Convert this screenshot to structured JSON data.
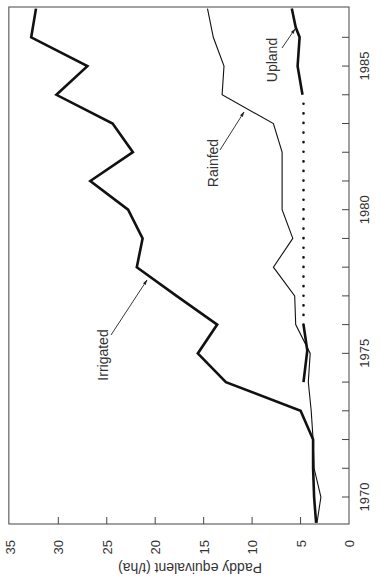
{
  "chart_data": {
    "type": "line",
    "orientation": "rotated-90-clockwise",
    "title": "",
    "xlabel": "",
    "ylabel": "Paddy equivalent (t/ha)",
    "xlim": [
      1969.1,
      1987
    ],
    "ylim": [
      0,
      35
    ],
    "x_ticks": [
      1970,
      1975,
      1980,
      1985
    ],
    "x_minor_ticks": [
      1970,
      1971,
      1972,
      1973,
      1974,
      1975,
      1976,
      1977,
      1978,
      1979,
      1980,
      1981,
      1982,
      1983,
      1984,
      1985,
      1986
    ],
    "y_ticks": [
      0,
      5,
      10,
      15,
      20,
      25,
      30,
      35
    ],
    "grid": false,
    "legend": "inline labels",
    "series": [
      {
        "name": "Irrigated",
        "style": "thick-solid",
        "x": [
          1969.1,
          1970,
          1971,
          1972,
          1973,
          1974,
          1975,
          1976,
          1977,
          1978,
          1979,
          1980,
          1981,
          1982,
          1983,
          1984,
          1985,
          1986,
          1987
        ],
        "values": [
          3.4,
          3.6,
          3.7,
          3.7,
          5.0,
          12.7,
          15.6,
          13.6,
          17.8,
          21.9,
          21.3,
          22.8,
          26.7,
          22.3,
          24.4,
          30.2,
          27.0,
          32.8,
          32.3
        ]
      },
      {
        "name": "Rainfed",
        "style": "thin-solid",
        "x": [
          1969.1,
          1970,
          1971,
          1972,
          1973,
          1974,
          1975,
          1976,
          1977,
          1978,
          1979,
          1980,
          1981,
          1982,
          1983,
          1984,
          1985,
          1986,
          1987
        ],
        "values": [
          3.3,
          2.9,
          3.6,
          3.7,
          3.9,
          4.2,
          4.0,
          5.5,
          5.6,
          7.8,
          5.8,
          6.9,
          6.9,
          6.9,
          7.8,
          13.1,
          12.9,
          14.0,
          14.6
        ]
      },
      {
        "name": "Upland",
        "style": "thick-solid",
        "x": [
          1974,
          1975.1,
          1976
        ],
        "values": [
          4.7,
          4.3,
          4.7
        ]
      },
      {
        "name": "Upland (estimated)",
        "style": "dotted",
        "x": [
          1976,
          1984
        ],
        "values": [
          4.7,
          4.7
        ]
      },
      {
        "name": "Upland",
        "style": "thick-solid",
        "x": [
          1984,
          1985,
          1986,
          1986.35,
          1987
        ],
        "values": [
          4.8,
          5.3,
          5.1,
          5.5,
          5.9
        ]
      }
    ],
    "annotations": [
      {
        "text": "Irrigated",
        "arrow_to": [
          1978,
          21.2
        ]
      },
      {
        "text": "Rainfed",
        "arrow_to": [
          1983.6,
          10.7
        ]
      },
      {
        "text": "Upland",
        "arrow_to": [
          1986.35,
          5.5
        ]
      }
    ]
  },
  "labels": {
    "ylabel": "Paddy equivalent (t/ha)",
    "irrigated": "Irrigated",
    "rainfed": "Rainfed",
    "upland": "Upland"
  }
}
